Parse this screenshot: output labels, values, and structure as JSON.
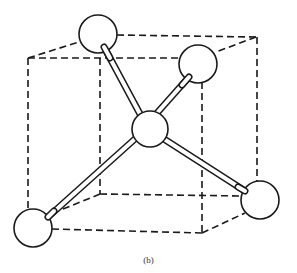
{
  "figure": {
    "caption": "(b)",
    "colors": {
      "line": "#1a1a1a",
      "atom_fill": "#ffffff",
      "background": "#ffffff"
    },
    "atoms": [
      {
        "id": "top-left",
        "cx": 98,
        "cy": 34,
        "r": 19
      },
      {
        "id": "top-right",
        "cx": 198,
        "cy": 64,
        "r": 19
      },
      {
        "id": "center",
        "cx": 150,
        "cy": 129,
        "r": 18
      },
      {
        "id": "bottom-left",
        "cx": 33,
        "cy": 228,
        "r": 19
      },
      {
        "id": "bottom-right",
        "cx": 260,
        "cy": 200,
        "r": 19
      }
    ],
    "bonds": [
      [
        "center",
        "top-left"
      ],
      [
        "center",
        "top-right"
      ],
      [
        "center",
        "bottom-left"
      ],
      [
        "center",
        "bottom-right"
      ]
    ]
  }
}
